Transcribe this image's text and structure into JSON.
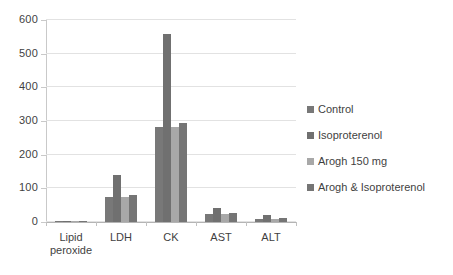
{
  "chart_data": {
    "type": "bar",
    "title": "",
    "subtitle": "",
    "xlabel": "",
    "ylabel": "",
    "ylim": [
      0,
      600
    ],
    "yticks": [
      0,
      100,
      200,
      300,
      400,
      500,
      600
    ],
    "grid": true,
    "legend_position": "right",
    "categories": [
      "Lipid peroxide",
      "LDH",
      "CK",
      "AST",
      "ALT"
    ],
    "category_labels_display": [
      "Lipid\nperoxide",
      "LDH",
      "CK",
      "AST",
      "ALT"
    ],
    "series": [
      {
        "name": "Control",
        "color": "#787878",
        "values": [
          1.5,
          75,
          283,
          25,
          10
        ]
      },
      {
        "name": "Isoproterenol",
        "color": "#707070",
        "values": [
          2,
          140,
          558,
          43,
          20
        ]
      },
      {
        "name": "Arogh 150 mg",
        "color": "#a8a8a8",
        "values": [
          1.5,
          75,
          283,
          25,
          8
        ]
      },
      {
        "name": "Arogh & Isoproterenol",
        "color": "#757575",
        "values": [
          1.5,
          81,
          293,
          27,
          11
        ]
      }
    ]
  },
  "legend": {
    "items": [
      {
        "label": "Control",
        "color": "#787878"
      },
      {
        "label": "Isoproterenol",
        "color": "#707070"
      },
      {
        "label": "Arogh 150 mg",
        "color": "#a8a8a8"
      },
      {
        "label": "Arogh & Isoproterenol",
        "color": "#757575"
      }
    ]
  },
  "axis": {
    "y_tick_labels": [
      "600",
      "500",
      "400",
      "300",
      "200",
      "100",
      "0"
    ]
  },
  "colors": {
    "gridline": "#e2e2e2",
    "axis": "#c0c0c0",
    "text": "#3f3f3f",
    "background": "#ffffff"
  }
}
